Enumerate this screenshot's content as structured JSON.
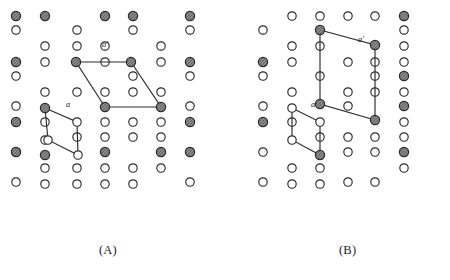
{
  "figure": {
    "title": "",
    "panels": [
      {
        "id": "A",
        "caption": "(A)",
        "caption_pos": [
          99,
          243
        ],
        "vector_labels": [
          {
            "text": "a",
            "pos": [
              66,
              107
            ],
            "style": "italic"
          },
          {
            "text": "a'",
            "pos": [
              102,
              47
            ],
            "style": "italic"
          }
        ],
        "small_cell": {
          "name": "primitive-unit-cell",
          "label": "a",
          "vertices": [
            [
              45,
              108
            ],
            [
              77,
              122
            ],
            [
              78,
              155
            ],
            [
              48,
              140
            ]
          ]
        },
        "large_cell": {
          "name": "supercell",
          "label": "a'",
          "vertices": [
            [
              76,
              62
            ],
            [
              131,
              62
            ],
            [
              161,
              107
            ],
            [
              105,
              107
            ]
          ]
        },
        "lattice": {
          "description": "alternating columns of open and shaded circles",
          "open_radius": 4.2,
          "shaded_radius": 4.6,
          "open_points": [
            [
              16,
              30
            ],
            [
              16,
              76
            ],
            [
              16,
              106
            ],
            [
              16,
              152
            ],
            [
              16,
              182
            ],
            [
              45,
              46
            ],
            [
              45,
              62
            ],
            [
              45,
              92
            ],
            [
              45,
              122
            ],
            [
              45,
              140
            ],
            [
              45,
              168
            ],
            [
              45,
              184
            ],
            [
              77,
              30
            ],
            [
              77,
              46
            ],
            [
              77,
              92
            ],
            [
              77,
              122
            ],
            [
              77,
              137
            ],
            [
              77,
              168
            ],
            [
              77,
              184
            ],
            [
              105,
              46
            ],
            [
              105,
              62
            ],
            [
              105,
              92
            ],
            [
              105,
              122
            ],
            [
              105,
              137
            ],
            [
              105,
              168
            ],
            [
              105,
              184
            ],
            [
              133,
              30
            ],
            [
              133,
              76
            ],
            [
              133,
              92
            ],
            [
              133,
              122
            ],
            [
              133,
              137
            ],
            [
              133,
              168
            ],
            [
              133,
              184
            ],
            [
              161,
              46
            ],
            [
              161,
              62
            ],
            [
              161,
              92
            ],
            [
              161,
              122
            ],
            [
              161,
              137
            ],
            [
              161,
              168
            ],
            [
              190,
              30
            ],
            [
              190,
              76
            ],
            [
              190,
              106
            ],
            [
              190,
              152
            ],
            [
              190,
              182
            ]
          ],
          "shaded_points": [
            [
              16,
              16
            ],
            [
              16,
              62
            ],
            [
              16,
              122
            ],
            [
              16,
              152
            ],
            [
              45,
              16
            ],
            [
              45,
              108
            ],
            [
              45,
              155
            ],
            [
              76,
              62
            ],
            [
              105,
              16
            ],
            [
              105,
              107
            ],
            [
              105,
              152
            ],
            [
              131,
              62
            ],
            [
              133,
              16
            ],
            [
              161,
              107
            ],
            [
              161,
              152
            ],
            [
              190,
              16
            ],
            [
              190,
              62
            ],
            [
              190,
              122
            ],
            [
              190,
              152
            ]
          ]
        }
      },
      {
        "id": "B",
        "caption": "(B)",
        "caption_pos": [
          339,
          243
        ],
        "vector_labels": [
          {
            "text": "a",
            "pos": [
              311,
              107
            ],
            "style": "italic"
          },
          {
            "text": "a'",
            "pos": [
              358,
              42
            ],
            "style": "italic"
          }
        ],
        "small_cell": {
          "name": "primitive-unit-cell",
          "label": "a",
          "vertices": [
            [
              292,
              108
            ],
            [
              320,
              122
            ],
            [
              320,
              155
            ],
            [
              292,
              140
            ]
          ]
        },
        "large_cell": {
          "name": "supercell",
          "label": "a'",
          "vertices": [
            [
              320,
              30
            ],
            [
              375,
              45
            ],
            [
              375,
              120
            ],
            [
              320,
              104
            ]
          ]
        },
        "lattice": {
          "description": "alternating columns of open and shaded circles, rotated variant",
          "open_radius": 4.2,
          "shaded_radius": 4.6,
          "open_points": [
            [
              263,
              30
            ],
            [
              263,
              76
            ],
            [
              263,
              106
            ],
            [
              263,
              152
            ],
            [
              263,
              182
            ],
            [
              292,
              16
            ],
            [
              292,
              46
            ],
            [
              292,
              62
            ],
            [
              292,
              92
            ],
            [
              292,
              108
            ],
            [
              292,
              122
            ],
            [
              292,
              140
            ],
            [
              292,
              168
            ],
            [
              292,
              184
            ],
            [
              320,
              16
            ],
            [
              320,
              46
            ],
            [
              320,
              76
            ],
            [
              320,
              122
            ],
            [
              320,
              137
            ],
            [
              320,
              168
            ],
            [
              320,
              184
            ],
            [
              348,
              16
            ],
            [
              348,
              62
            ],
            [
              348,
              92
            ],
            [
              348,
              106
            ],
            [
              348,
              137
            ],
            [
              348,
              152
            ],
            [
              348,
              182
            ],
            [
              375,
              16
            ],
            [
              375,
              62
            ],
            [
              375,
              76
            ],
            [
              375,
              92
            ],
            [
              375,
              137
            ],
            [
              375,
              152
            ],
            [
              375,
              182
            ],
            [
              404,
              30
            ],
            [
              404,
              46
            ],
            [
              404,
              62
            ],
            [
              404,
              92
            ],
            [
              404,
              122
            ],
            [
              404,
              137
            ],
            [
              404,
              168
            ]
          ],
          "shaded_points": [
            [
              263,
              62
            ],
            [
              263,
              122
            ],
            [
              320,
              30
            ],
            [
              320,
              104
            ],
            [
              320,
              155
            ],
            [
              375,
              45
            ],
            [
              375,
              120
            ],
            [
              404,
              16
            ],
            [
              404,
              76
            ],
            [
              404,
              106
            ],
            [
              404,
              152
            ]
          ]
        }
      }
    ],
    "style": {
      "line_color": "#2b2b2b",
      "circle_stroke": "#2b2b2b",
      "open_fill": "#ffffff",
      "shaded_fill": "#9a9a9a",
      "background": "#ffffff"
    }
  }
}
